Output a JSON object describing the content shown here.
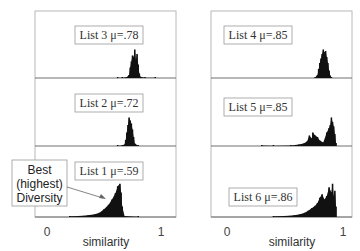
{
  "chart_data": {
    "type": "bar",
    "title": "",
    "xlabel": "similarity",
    "xlim": [
      0,
      1
    ],
    "x_ticks": [
      "0",
      "1"
    ],
    "layout": "2 columns x 3 rows of histograms",
    "panels": [
      {
        "column": "left",
        "row": 1,
        "name": "List 3",
        "mean_label": "μ=.78",
        "mean": 0.78,
        "bins": [
          [
            0.62,
            0.01
          ],
          [
            0.66,
            0.01
          ],
          [
            0.7,
            0.03
          ],
          [
            0.72,
            0.1
          ],
          [
            0.73,
            0.35
          ],
          [
            0.74,
            0.55
          ],
          [
            0.75,
            0.75
          ],
          [
            0.76,
            0.7
          ],
          [
            0.77,
            0.95
          ],
          [
            0.78,
            0.6
          ],
          [
            0.79,
            0.8
          ],
          [
            0.8,
            0.45
          ],
          [
            0.81,
            0.15
          ],
          [
            0.82,
            0.04
          ],
          [
            0.86,
            0.01
          ],
          [
            0.95,
            0.01
          ]
        ]
      },
      {
        "column": "left",
        "row": 2,
        "name": "List 2",
        "mean_label": "μ=.72",
        "mean": 0.72,
        "bins": [
          [
            0.62,
            0.01
          ],
          [
            0.66,
            0.02
          ],
          [
            0.68,
            0.05
          ],
          [
            0.69,
            0.2
          ],
          [
            0.7,
            0.45
          ],
          [
            0.71,
            0.7
          ],
          [
            0.72,
            0.95
          ],
          [
            0.73,
            0.85
          ],
          [
            0.74,
            0.75
          ],
          [
            0.75,
            0.55
          ],
          [
            0.76,
            0.3
          ],
          [
            0.77,
            0.08
          ],
          [
            0.8,
            0.01
          ]
        ]
      },
      {
        "column": "left",
        "row": 3,
        "name": "List 1",
        "mean_label": "μ=.59",
        "mean": 0.59,
        "bins": [
          [
            0.2,
            0.02
          ],
          [
            0.28,
            0.03
          ],
          [
            0.36,
            0.05
          ],
          [
            0.42,
            0.08
          ],
          [
            0.46,
            0.12
          ],
          [
            0.5,
            0.22
          ],
          [
            0.54,
            0.35
          ],
          [
            0.57,
            0.5
          ],
          [
            0.6,
            0.68
          ],
          [
            0.62,
            0.88
          ],
          [
            0.64,
            0.95
          ],
          [
            0.65,
            0.7
          ],
          [
            0.66,
            0.3
          ],
          [
            0.68,
            0.03
          ],
          [
            0.8,
            0.01
          ]
        ]
      },
      {
        "column": "right",
        "row": 1,
        "name": "List 4",
        "mean_label": "μ=.85",
        "mean": 0.85,
        "bins": [
          [
            0.76,
            0.02
          ],
          [
            0.78,
            0.1
          ],
          [
            0.79,
            0.3
          ],
          [
            0.8,
            0.5
          ],
          [
            0.81,
            0.65
          ],
          [
            0.82,
            0.8
          ],
          [
            0.83,
            0.95
          ],
          [
            0.84,
            0.85
          ],
          [
            0.85,
            0.9
          ],
          [
            0.86,
            0.7
          ],
          [
            0.87,
            0.5
          ],
          [
            0.88,
            0.25
          ],
          [
            0.89,
            0.08
          ],
          [
            0.9,
            0.02
          ]
        ]
      },
      {
        "column": "right",
        "row": 2,
        "name": "List 5",
        "mean_label": "μ=.85",
        "mean": 0.85,
        "bins": [
          [
            0.3,
            0.02
          ],
          [
            0.4,
            0.01
          ],
          [
            0.55,
            0.02
          ],
          [
            0.62,
            0.05
          ],
          [
            0.66,
            0.08
          ],
          [
            0.69,
            0.15
          ],
          [
            0.71,
            0.35
          ],
          [
            0.73,
            0.25
          ],
          [
            0.74,
            0.45
          ],
          [
            0.76,
            0.35
          ],
          [
            0.78,
            0.3
          ],
          [
            0.8,
            0.18
          ],
          [
            0.83,
            0.12
          ],
          [
            0.86,
            0.45
          ],
          [
            0.88,
            0.6
          ],
          [
            0.89,
            0.7
          ],
          [
            0.9,
            0.95
          ],
          [
            0.91,
            0.8
          ],
          [
            0.92,
            0.65
          ],
          [
            0.93,
            0.4
          ],
          [
            0.94,
            0.1
          ]
        ]
      },
      {
        "column": "right",
        "row": 3,
        "name": "List 6",
        "mean_label": "μ=.86",
        "mean": 0.86,
        "bins": [
          [
            0.4,
            0.02
          ],
          [
            0.5,
            0.03
          ],
          [
            0.58,
            0.05
          ],
          [
            0.63,
            0.08
          ],
          [
            0.67,
            0.12
          ],
          [
            0.7,
            0.18
          ],
          [
            0.73,
            0.25
          ],
          [
            0.76,
            0.32
          ],
          [
            0.78,
            0.4
          ],
          [
            0.8,
            0.55
          ],
          [
            0.82,
            0.65
          ],
          [
            0.84,
            0.5
          ],
          [
            0.86,
            0.6
          ],
          [
            0.88,
            0.85
          ],
          [
            0.9,
            0.7
          ],
          [
            0.91,
            0.95
          ],
          [
            0.92,
            0.6
          ],
          [
            0.93,
            0.75
          ],
          [
            0.94,
            0.3
          ]
        ]
      }
    ],
    "annotations": [
      {
        "text_lines": [
          "Best",
          "(highest)",
          "Diversity"
        ],
        "points_to": "List 1"
      }
    ]
  }
}
